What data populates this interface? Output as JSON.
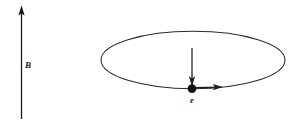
{
  "figure": {
    "background_color": "#ffffff",
    "ink_color": "#1c1c1c",
    "labels": {
      "magnetic_field": "B",
      "electron": "e"
    },
    "elements": {
      "field_arrow": {
        "name": "magnetic-field-arrow",
        "direction": "up",
        "x": 21.5,
        "y_tail": 119,
        "y_tip": 6,
        "label": "B",
        "label_x": 25,
        "label_y": 66
      },
      "orbit": {
        "name": "electron-orbit-ellipse",
        "center_x": 193,
        "center_y": 60,
        "radius_x": 92,
        "radius_y": 29
      },
      "force_arrow": {
        "name": "centripetal-force-arrow",
        "direction": "down",
        "x": 192,
        "y_tail": 48,
        "y_tip": 86
      },
      "velocity_arrow": {
        "name": "velocity-arrow",
        "direction": "right",
        "y": 87.5,
        "x_tail": 197,
        "x_tip": 223
      },
      "electron_dot": {
        "name": "electron-particle-dot",
        "center_x": 192,
        "center_y": 88.5,
        "radius": 4.3,
        "label": "e",
        "label_x": 192,
        "label_y": 101
      }
    }
  }
}
